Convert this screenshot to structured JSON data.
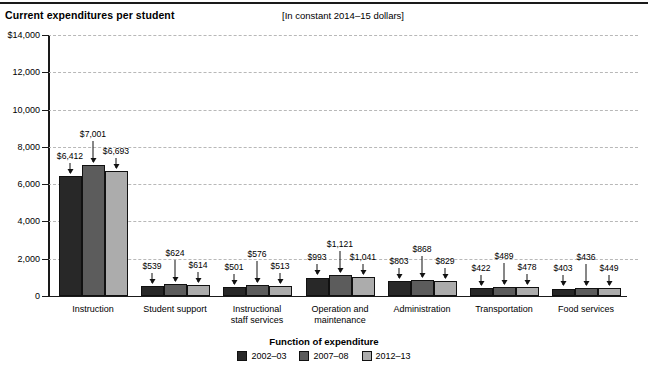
{
  "header": {
    "title": "Current expenditures per student",
    "units_note": "[In constant 2014–15 dollars]"
  },
  "axis": {
    "x_title": "Function of expenditure",
    "y_tick_labels": [
      "$14,000",
      "12,000",
      "10,000",
      "8,000",
      "6,000",
      "4,000",
      "2,000",
      "0"
    ]
  },
  "legend": {
    "items": [
      {
        "label": "2002–03",
        "color": "#282828"
      },
      {
        "label": "2007–08",
        "color": "#5c5c5c"
      },
      {
        "label": "2012–13",
        "color": "#acacac"
      }
    ]
  },
  "chart_data": {
    "type": "bar",
    "title": "Current expenditures per student",
    "subtitle": "[In constant 2014–15 dollars]",
    "xlabel": "Function of expenditure",
    "ylabel": "",
    "ylim": [
      0,
      14000
    ],
    "yticks": [
      0,
      2000,
      4000,
      6000,
      8000,
      10000,
      12000,
      14000
    ],
    "ytick_labels": [
      "0",
      "2,000",
      "4,000",
      "6,000",
      "8,000",
      "10,000",
      "12,000",
      "$14,000"
    ],
    "grid": true,
    "legend_position": "bottom",
    "categories": [
      "Instruction",
      "Student support",
      "Instructional\nstaff services",
      "Operation and\nmaintenance",
      "Administration",
      "Transportation",
      "Food services"
    ],
    "series": [
      {
        "name": "2002–03",
        "color": "#282828",
        "values": [
          6412,
          539,
          501,
          993,
          803,
          422,
          403
        ],
        "labels": [
          "$6,412",
          "$539",
          "$501",
          "$993",
          "$803",
          "$422",
          "$403"
        ]
      },
      {
        "name": "2007–08",
        "color": "#5c5c5c",
        "values": [
          7001,
          624,
          576,
          1121,
          868,
          489,
          436
        ],
        "labels": [
          "$7,001",
          "$624",
          "$576",
          "$1,121",
          "$868",
          "$489",
          "$436"
        ]
      },
      {
        "name": "2012–13",
        "color": "#acacac",
        "values": [
          6693,
          614,
          513,
          1041,
          829,
          478,
          449
        ],
        "labels": [
          "$6,693",
          "$614",
          "$513",
          "$1,041",
          "$829",
          "$478",
          "$449"
        ]
      }
    ]
  }
}
